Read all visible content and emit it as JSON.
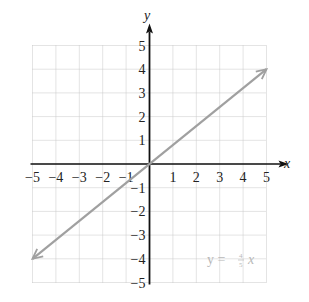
{
  "chart_data": {
    "type": "line",
    "title": "",
    "xlabel": "x",
    "ylabel": "y",
    "xlim": [
      -5,
      5
    ],
    "ylim": [
      -5,
      5
    ],
    "grid": true,
    "x_ticks": [
      -5,
      -4,
      -3,
      -2,
      -1,
      1,
      2,
      3,
      4,
      5
    ],
    "y_ticks": [
      5,
      4,
      3,
      2,
      1,
      -1,
      -2,
      -3,
      -4,
      -5
    ],
    "series": [
      {
        "name": "y = 4/5 x",
        "equation": "y = (4/5)x",
        "slope": 0.8,
        "intercept": 0,
        "x": [
          -5,
          0,
          5
        ],
        "y": [
          -4,
          0,
          4
        ],
        "arrows_both_ends": true,
        "color": "#a0a0a0"
      }
    ],
    "annotations": [
      {
        "text": "y = 4/5 x",
        "x": 3.6,
        "y": -3.5
      }
    ]
  },
  "labels": {
    "x_axis": "x",
    "y_axis": "y",
    "equation_lhs": "y =",
    "equation_num": "4",
    "equation_den": "5",
    "equation_var": "x"
  },
  "colors": {
    "axis": "#111111",
    "grid": "#c8c8c8",
    "line": "#a0a0a0",
    "equation": "#b8b8b8"
  }
}
